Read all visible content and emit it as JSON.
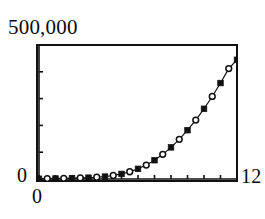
{
  "figure": {
    "background_color": "#ffffff",
    "ink_color": "#111111"
  },
  "labels": {
    "y_max": "500,000",
    "y_min": "0",
    "x_min": "0",
    "x_max": "12"
  },
  "chart_data": {
    "type": "line",
    "title": "",
    "subtitle": "",
    "xlabel": "",
    "ylabel": "",
    "xlim": [
      0,
      12
    ],
    "ylim": [
      0,
      500000
    ],
    "x_tick_labels": [
      "0",
      "12"
    ],
    "y_tick_labels": [
      "0",
      "500,000"
    ],
    "x_tick_count": 13,
    "y_tick_count": 6,
    "x_tick_interval": 1,
    "y_tick_interval": 100000,
    "grid": false,
    "legend": false,
    "legend_position": "none",
    "line_color": "#111111",
    "line_width": 1.2,
    "marker_styles": [
      "filled-square",
      "open-circle"
    ],
    "marker_fill_colors": [
      "#111111",
      "#ffffff"
    ],
    "marker_edge_color": "#111111",
    "x": [
      0,
      0.5,
      1,
      1.5,
      2,
      2.5,
      3,
      3.5,
      4,
      4.5,
      5,
      5.5,
      6,
      6.5,
      7,
      7.5,
      8,
      8.5,
      9,
      9.5,
      10,
      10.5,
      11,
      11.5,
      12
    ],
    "y": [
      1000,
      1500,
      2000,
      2500,
      3000,
      4000,
      5000,
      6500,
      9000,
      13000,
      19000,
      27000,
      38000,
      52000,
      70000,
      92000,
      118000,
      148000,
      182000,
      220000,
      262000,
      308000,
      358000,
      412000,
      445000
    ],
    "series": [
      {
        "name": "series-filled",
        "marker": "filled-square",
        "x": [
          0,
          1,
          2,
          3,
          4,
          5,
          6,
          7,
          8,
          9,
          10,
          11,
          12
        ],
        "y": [
          1000,
          2000,
          3000,
          5000,
          9000,
          19000,
          38000,
          70000,
          118000,
          182000,
          262000,
          358000,
          445000
        ]
      },
      {
        "name": "series-open",
        "marker": "open-circle",
        "x": [
          0.5,
          1.5,
          2.5,
          3.5,
          4.5,
          5.5,
          6.5,
          7.5,
          8.5,
          9.5,
          10.5,
          11.5
        ],
        "y": [
          1500,
          2500,
          4000,
          6500,
          13000,
          27000,
          52000,
          92000,
          148000,
          220000,
          308000,
          412000
        ]
      }
    ],
    "annotations": []
  }
}
